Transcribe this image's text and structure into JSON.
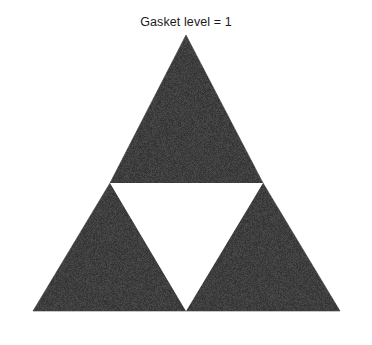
{
  "figure": {
    "title": "Gasket level = 1",
    "background_color": "#ffffff",
    "width": 372,
    "height": 345
  },
  "chart_data": {
    "type": "diagram",
    "title": "Gasket level = 1",
    "subtitle": "",
    "xlabel": "",
    "ylabel": "",
    "grid": false,
    "legend": "none",
    "axes_visible": false,
    "shape": "sierpinski-gasket",
    "level": 1,
    "fill_color": "#3e3e3e",
    "hole_color": "#ffffff",
    "outer_triangle": {
      "label": "outer-triangle",
      "vertices": [
        [
          186,
          35
        ],
        [
          33,
          311
        ],
        [
          340,
          311
        ]
      ]
    },
    "holes": [
      {
        "label": "central-inverted-triangle",
        "vertices": [
          [
            110,
            183
          ],
          [
            263,
            183
          ],
          [
            186,
            311
          ]
        ]
      }
    ],
    "filled_triangles": [
      {
        "label": "top-triangle",
        "vertices": [
          [
            186,
            35
          ],
          [
            110,
            183
          ],
          [
            263,
            183
          ]
        ]
      },
      {
        "label": "bottom-left-triangle",
        "vertices": [
          [
            110,
            183
          ],
          [
            33,
            311
          ],
          [
            186,
            311
          ]
        ]
      },
      {
        "label": "bottom-right-triangle",
        "vertices": [
          [
            263,
            183
          ],
          [
            186,
            311
          ],
          [
            340,
            311
          ]
        ]
      }
    ],
    "counts": {
      "filled_triangles": 3,
      "holes": 1
    }
  }
}
